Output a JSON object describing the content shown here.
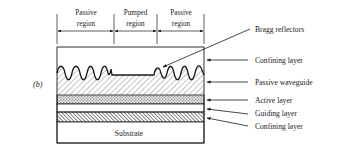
{
  "figure": {
    "panel_label": "(b)",
    "regions": [
      {
        "line1": "Passive",
        "line2": "region"
      },
      {
        "line1": "Pumped",
        "line2": "region"
      },
      {
        "line1": "Passive",
        "line2": "region"
      }
    ],
    "layer_labels": [
      "Bragg reflectors",
      "Confining layer",
      "Passive waveguide",
      "Active layer",
      "Guiding layer",
      "Confining layer"
    ],
    "substrate_label": "Substrate"
  },
  "colors": {
    "ink": "#1a1a1a",
    "background": "#ffffff"
  }
}
